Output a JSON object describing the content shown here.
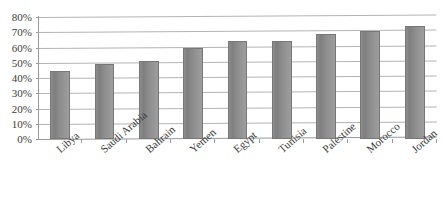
{
  "chart_data": {
    "type": "bar",
    "title": "",
    "xlabel": "",
    "ylabel": "",
    "ylim": [
      0,
      80
    ],
    "ytick_values": [
      80,
      70,
      60,
      50,
      40,
      30,
      20,
      10,
      0
    ],
    "ytick_labels": [
      "80%",
      "70%",
      "60%",
      "50%",
      "40%",
      "30%",
      "20%",
      "10%",
      "0%"
    ],
    "grid": true,
    "legend": false,
    "bar_color": "#8e8e8e",
    "categories": [
      "Libya",
      "Saudi Arabia",
      "Bahrain",
      "Yemen",
      "Egypt",
      "Tunisia",
      "Palestine",
      "Morocco",
      "Jordan"
    ],
    "values": [
      44.5,
      49,
      51,
      60,
      64,
      64.5,
      69,
      71,
      74
    ],
    "value_unit": "%",
    "series": [
      {
        "name": "",
        "values": [
          44.5,
          49,
          51,
          60,
          64,
          64.5,
          69,
          71,
          74
        ]
      }
    ]
  },
  "axes": {
    "y": {
      "ticks": [
        {
          "label": "80%",
          "value": 80
        },
        {
          "label": "70%",
          "value": 70
        },
        {
          "label": "60%",
          "value": 60
        },
        {
          "label": "50%",
          "value": 50
        },
        {
          "label": "40%",
          "value": 40
        },
        {
          "label": "30%",
          "value": 30
        },
        {
          "label": "20%",
          "value": 20
        },
        {
          "label": "10%",
          "value": 10
        },
        {
          "label": "0%",
          "value": 0
        }
      ]
    },
    "x": {
      "ticks": [
        {
          "label": "Libya"
        },
        {
          "label": "Saudi Arabia"
        },
        {
          "label": "Bahrain"
        },
        {
          "label": "Yemen"
        },
        {
          "label": "Egypt"
        },
        {
          "label": "Tunisia"
        },
        {
          "label": "Palestine"
        },
        {
          "label": "Morocco"
        },
        {
          "label": "Jordan"
        }
      ]
    }
  }
}
